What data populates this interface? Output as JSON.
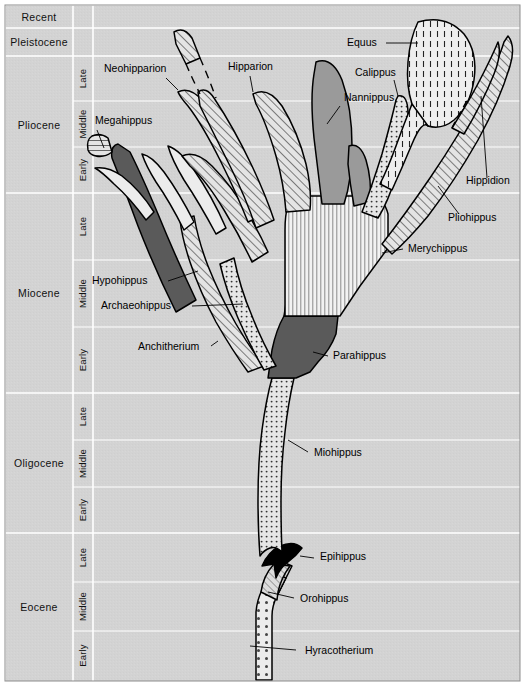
{
  "figure": {
    "background_color": "#d4d4d4",
    "panel_color": "#d2d2d2",
    "outline_color": "#000000"
  },
  "timescale": {
    "epoch_header": "Epoch",
    "epochs": [
      {
        "name": "Recent",
        "y_top": 5,
        "y_bottom": 28,
        "subdivisions": []
      },
      {
        "name": "Pleistocene",
        "y_top": 28,
        "y_bottom": 56,
        "subdivisions": []
      },
      {
        "name": "Pliocene",
        "y_top": 56,
        "y_bottom": 193,
        "subdivisions": [
          {
            "name": "Late",
            "y_top": 56,
            "y_bottom": 101
          },
          {
            "name": "Middle",
            "y_top": 101,
            "y_bottom": 147
          },
          {
            "name": "Early",
            "y_top": 147,
            "y_bottom": 193
          }
        ]
      },
      {
        "name": "Miocene",
        "y_top": 193,
        "y_bottom": 393,
        "subdivisions": [
          {
            "name": "Late",
            "y_top": 193,
            "y_bottom": 260
          },
          {
            "name": "Middle",
            "y_top": 260,
            "y_bottom": 327
          },
          {
            "name": "Early",
            "y_top": 327,
            "y_bottom": 393
          }
        ]
      },
      {
        "name": "Oligocene",
        "y_top": 393,
        "y_bottom": 533,
        "subdivisions": [
          {
            "name": "Late",
            "y_top": 393,
            "y_bottom": 440
          },
          {
            "name": "Middle",
            "y_top": 440,
            "y_bottom": 487
          },
          {
            "name": "Early",
            "y_top": 487,
            "y_bottom": 533
          }
        ]
      },
      {
        "name": "Eocene",
        "y_top": 533,
        "y_bottom": 680,
        "subdivisions": [
          {
            "name": "Late",
            "y_top": 533,
            "y_bottom": 582
          },
          {
            "name": "Middle",
            "y_top": 582,
            "y_bottom": 631
          },
          {
            "name": "Early",
            "y_top": 631,
            "y_bottom": 680
          }
        ]
      }
    ],
    "epoch_column": {
      "x": 5,
      "width": 68
    },
    "subdivision_column": {
      "x": 73,
      "width": 20
    }
  },
  "taxa": [
    {
      "id": "hyracotherium",
      "label": "Hyracotherium",
      "fill": "dots-coarse",
      "label_x": 305,
      "label_y": 654,
      "leader": "M 250 646 L 296 650"
    },
    {
      "id": "orohippus",
      "label": "Orohippus",
      "fill": "hatch-fine",
      "label_x": 300,
      "label_y": 602,
      "leader": "M 268 592 L 294 598"
    },
    {
      "id": "epihippus",
      "label": "Epihippus",
      "fill": "solid-black",
      "label_x": 320,
      "label_y": 560,
      "leader": "M 300 556 L 314 558"
    },
    {
      "id": "miohippus",
      "label": "Miohippus",
      "fill": "dots-fine",
      "label_x": 314,
      "label_y": 456,
      "leader": "M 288 440 L 308 452"
    },
    {
      "id": "parahippus",
      "label": "Parahippus",
      "fill": "gray-dark",
      "label_x": 333,
      "label_y": 359,
      "leader": "M 313 352 L 328 356"
    },
    {
      "id": "anchitherium",
      "label": "Anchitherium",
      "fill": "hatch-diagonal",
      "label_x": 138,
      "label_y": 350,
      "leader": "M 211 346 L 218 341"
    },
    {
      "id": "archaeohippus",
      "label": "Archaeohippus",
      "fill": "dots-fine",
      "label_x": 101,
      "label_y": 309,
      "leader": "M 192 306 L 243 304"
    },
    {
      "id": "hypohippus",
      "label": "Hypohippus",
      "fill": "gray-dark",
      "label_x": 92,
      "label_y": 284,
      "leader": "M 168 281 L 198 271"
    },
    {
      "id": "megahippus",
      "label": "Megahippus",
      "fill": "hatch-horizontal",
      "label_x": 95,
      "label_y": 124,
      "leader": "M 97 130 L 104 148"
    },
    {
      "id": "neohipparion",
      "label": "Neohipparion",
      "fill": "hatch-diagonal",
      "label_x": 104,
      "label_y": 72,
      "leader": "M 166 78 L 178 90"
    },
    {
      "id": "hipparion",
      "label": "Hipparion",
      "fill": "hatch-diagonal",
      "label_x": 228,
      "label_y": 70,
      "leader": "M 250 76 L 253 92"
    },
    {
      "id": "nannippus",
      "label": "Nannippus",
      "fill": "gray-medium",
      "label_x": 344,
      "label_y": 101,
      "leader": "M 340 106 L 327 124"
    },
    {
      "id": "calippus",
      "label": "Calippus",
      "fill": "dots-fine",
      "label_x": 355,
      "label_y": 76,
      "leader": "M 394 80 L 398 96"
    },
    {
      "id": "equus",
      "label": "Equus",
      "fill": "dashes-vertical",
      "label_x": 347,
      "label_y": 46,
      "leader": "M 386 43 L 418 43"
    },
    {
      "id": "hippidion",
      "label": "Hippidion",
      "fill": "hatch-diagonal",
      "label_x": 466,
      "label_y": 184,
      "leader": "M 487 178 L 481 96"
    },
    {
      "id": "pliohippus",
      "label": "Pliohippus",
      "fill": "hatch-diagonal",
      "label_x": 448,
      "label_y": 221,
      "leader": "M 459 214 L 438 186"
    },
    {
      "id": "merychippus",
      "label": "Merychippus",
      "fill": "stripes-vertical",
      "label_x": 408,
      "label_y": 252,
      "leader": "M 403 249 L 382 253"
    }
  ],
  "fills": {
    "gray-dark": "#5a5a5a",
    "gray-medium": "#9a9a9a",
    "solid-black": "#000000",
    "panel": "#d2d2d2",
    "light": "#e8e8e8"
  },
  "legend_note": ""
}
